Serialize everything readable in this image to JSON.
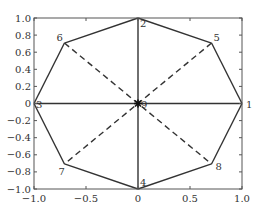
{
  "chart_data": {
    "type": "line",
    "title": "",
    "xlabel": "",
    "ylabel": "",
    "xlim": [
      -1.0,
      1.0
    ],
    "ylim": [
      -1.0,
      1.0
    ],
    "grid": false,
    "legend": null,
    "x_ticks": [
      -1.0,
      -0.5,
      0,
      0.5,
      1.0
    ],
    "x_tick_labels": [
      "-1.0",
      "-0.5",
      "0",
      "0.5",
      "1.0"
    ],
    "y_ticks": [
      -1.0,
      -0.8,
      -0.6,
      -0.4,
      -0.2,
      0,
      0.2,
      0.4,
      0.6,
      0.8,
      1.0
    ],
    "y_tick_labels": [
      "-1.0",
      "-0.8",
      "-0.6",
      "-0.4",
      "-0.2",
      "0",
      "0.2",
      "0.4",
      "0.6",
      "0.8",
      "1.0"
    ],
    "nodes": [
      {
        "id": "1",
        "x": 1.0,
        "y": 0.0
      },
      {
        "id": "2",
        "x": 0.0,
        "y": 1.0
      },
      {
        "id": "3",
        "x": -1.0,
        "y": 0.0
      },
      {
        "id": "4",
        "x": 0.0,
        "y": -1.0
      },
      {
        "id": "5",
        "x": 0.707,
        "y": 0.707
      },
      {
        "id": "6",
        "x": -0.707,
        "y": 0.707
      },
      {
        "id": "7",
        "x": -0.707,
        "y": -0.707
      },
      {
        "id": "8",
        "x": 0.707,
        "y": -0.707
      },
      {
        "id": "9",
        "x": 0.0,
        "y": 0.0
      }
    ],
    "edges": [
      {
        "from": "1",
        "to": "5",
        "style": "solid"
      },
      {
        "from": "5",
        "to": "2",
        "style": "solid"
      },
      {
        "from": "2",
        "to": "6",
        "style": "solid"
      },
      {
        "from": "6",
        "to": "3",
        "style": "solid"
      },
      {
        "from": "3",
        "to": "7",
        "style": "solid"
      },
      {
        "from": "7",
        "to": "4",
        "style": "solid"
      },
      {
        "from": "4",
        "to": "8",
        "style": "solid"
      },
      {
        "from": "8",
        "to": "1",
        "style": "solid"
      },
      {
        "from": "1",
        "to": "3",
        "style": "solid"
      },
      {
        "from": "2",
        "to": "4",
        "style": "solid"
      },
      {
        "from": "5",
        "to": "7",
        "style": "dashed"
      },
      {
        "from": "6",
        "to": "8",
        "style": "dashed"
      }
    ],
    "center_marker": {
      "node": "9",
      "symbol": "asterisk"
    },
    "colors": {
      "line": "#333333",
      "axes": "#555555",
      "background": "#ffffff"
    }
  }
}
